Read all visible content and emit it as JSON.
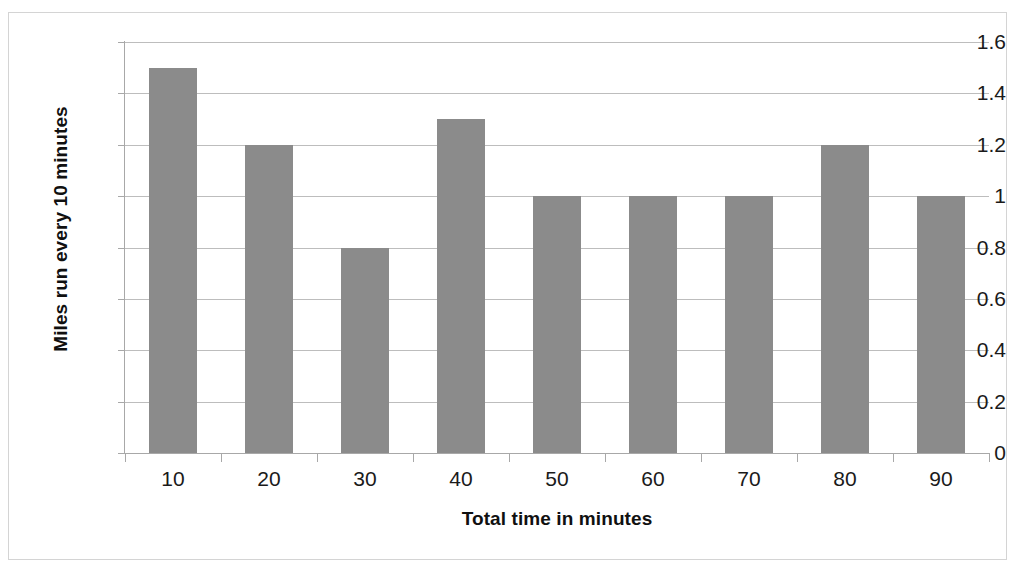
{
  "caption_fragment": "athlete ran in the race over time",
  "chart_data": {
    "type": "bar",
    "title": "",
    "xlabel": "Total time in minutes",
    "ylabel": "Miles run every 10 minutes",
    "categories": [
      "10",
      "20",
      "30",
      "40",
      "50",
      "60",
      "70",
      "80",
      "90"
    ],
    "values": [
      1.5,
      1.2,
      0.8,
      1.3,
      1.0,
      1.0,
      1.0,
      1.2,
      1.0
    ],
    "ylim": [
      0,
      1.6
    ],
    "ytick_labels": [
      "0",
      "0.2",
      "0.4",
      "0.6",
      "0.8",
      "1",
      "1.2",
      "1.4",
      "1.6"
    ],
    "ytick_values": [
      0,
      0.2,
      0.4,
      0.6,
      0.8,
      1.0,
      1.2,
      1.4,
      1.6
    ],
    "grid": true,
    "legend": "none",
    "bar_color": "#8b8b8b",
    "grid_color": "#bdbdbd",
    "axis_color": "#a8a8a8",
    "plot_background": "#ffffff",
    "border_color": "#d4d4d4"
  }
}
